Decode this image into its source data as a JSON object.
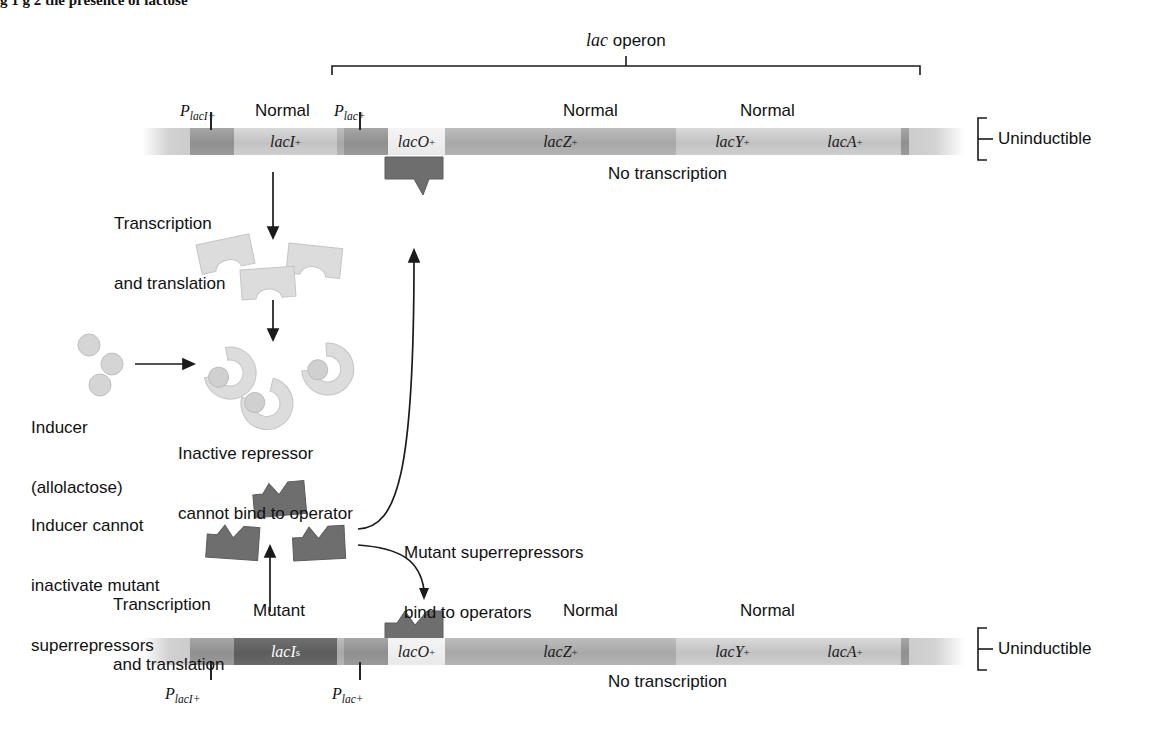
{
  "figure": {
    "caption_partial": "g 1 g 2 the presence of lactose",
    "operon_bracket_label_italic": "lac",
    "operon_bracket_label_rest": " operon"
  },
  "top_panel": {
    "outcome_label": "Uninductible",
    "transcription_status": "No transcription",
    "state_labels": [
      {
        "text": "Normal",
        "x": 255,
        "y": 101
      },
      {
        "text": "Normal",
        "x": 563,
        "y": 101
      },
      {
        "text": "Normal",
        "x": 740,
        "y": 101
      }
    ],
    "promoters": [
      {
        "label_main": "P",
        "label_sub": "lacI+",
        "x": 180,
        "y": 102,
        "tick_x": 210,
        "tick_y": 112,
        "tick_h": 18
      },
      {
        "label_main": "P",
        "label_sub": "lac+",
        "x": 334,
        "y": 102,
        "tick_x": 359,
        "tick_y": 112,
        "tick_h": 18
      }
    ],
    "segments": [
      {
        "name": "left-fade",
        "label": "",
        "sup": "",
        "x": 142,
        "w": 48,
        "style": "s-fadeL"
      },
      {
        "name": "promoter-lacI",
        "label": "",
        "sup": "",
        "x": 190,
        "w": 44,
        "style": "s-prom"
      },
      {
        "name": "lacI-gene",
        "label": "lacI",
        "sup": "+",
        "x": 234,
        "w": 103,
        "style": "s-light"
      },
      {
        "name": "spacer-1",
        "label": "",
        "sup": "",
        "x": 337,
        "w": 7,
        "style": "s-mid"
      },
      {
        "name": "promoter-lac",
        "label": "",
        "sup": "",
        "x": 344,
        "w": 44,
        "style": "s-prom"
      },
      {
        "name": "lacO-operator",
        "label": "lacO",
        "sup": "+",
        "x": 388,
        "w": 57,
        "style": "s-white"
      },
      {
        "name": "lacZ-gene",
        "label": "lacZ",
        "sup": "+",
        "x": 445,
        "w": 231,
        "style": "s-mid"
      },
      {
        "name": "lacY-gene",
        "label": "lacY",
        "sup": "+",
        "x": 676,
        "w": 113,
        "style": "s-light"
      },
      {
        "name": "lacA-gene",
        "label": "lacA",
        "sup": "+",
        "x": 789,
        "w": 112,
        "style": "s-light"
      },
      {
        "name": "spacer-2",
        "label": "",
        "sup": "",
        "x": 901,
        "w": 8,
        "style": "s-prom"
      },
      {
        "name": "right-fade",
        "label": "",
        "sup": "",
        "x": 909,
        "w": 56,
        "style": "s-fadeR"
      }
    ]
  },
  "bottom_panel": {
    "outcome_label": "Uninductible",
    "transcription_status": "No transcription",
    "state_labels": [
      {
        "text": "Mutant",
        "x": 253,
        "y": 601
      },
      {
        "text": "Normal",
        "x": 563,
        "y": 601
      },
      {
        "text": "Normal",
        "x": 740,
        "y": 601
      }
    ],
    "promoters": [
      {
        "label_main": "P",
        "label_sub": "lacI+",
        "x": 165,
        "y": 685,
        "tick_x": 210,
        "tick_y": 662,
        "tick_h": 18
      },
      {
        "label_main": "P",
        "label_sub": "lac+",
        "x": 332,
        "y": 685,
        "tick_x": 359,
        "tick_y": 662,
        "tick_h": 18
      }
    ],
    "segments": [
      {
        "name": "left-fade",
        "label": "",
        "sup": "",
        "x": 142,
        "w": 48,
        "style": "s-fadeL"
      },
      {
        "name": "promoter-lacI",
        "label": "",
        "sup": "",
        "x": 190,
        "w": 44,
        "style": "s-prom"
      },
      {
        "name": "lacIs-gene",
        "label": "lacI",
        "sup": "s",
        "x": 234,
        "w": 103,
        "style": "s-dark"
      },
      {
        "name": "spacer-1",
        "label": "",
        "sup": "",
        "x": 337,
        "w": 7,
        "style": "s-mid"
      },
      {
        "name": "promoter-lac",
        "label": "",
        "sup": "",
        "x": 344,
        "w": 44,
        "style": "s-prom"
      },
      {
        "name": "lacO-operator",
        "label": "lacO",
        "sup": "+",
        "x": 388,
        "w": 57,
        "style": "s-white"
      },
      {
        "name": "lacZ-gene",
        "label": "lacZ",
        "sup": "+",
        "x": 445,
        "w": 231,
        "style": "s-mid"
      },
      {
        "name": "lacY-gene",
        "label": "lacY",
        "sup": "+",
        "x": 676,
        "w": 113,
        "style": "s-light"
      },
      {
        "name": "lacA-gene",
        "label": "lacA",
        "sup": "+",
        "x": 789,
        "w": 112,
        "style": "s-light"
      },
      {
        "name": "spacer-2",
        "label": "",
        "sup": "",
        "x": 901,
        "w": 8,
        "style": "s-prom"
      },
      {
        "name": "right-fade",
        "label": "",
        "sup": "",
        "x": 909,
        "w": 56,
        "style": "s-fadeR"
      }
    ]
  },
  "annotations": {
    "transcription_translation_top_line1": "Transcription",
    "transcription_translation_top_line2": "and translation",
    "transcription_translation_bottom_line1": "Transcription",
    "transcription_translation_bottom_line2": "and translation",
    "inducer_line1": "Inducer",
    "inducer_line2": "(allolactose)",
    "inactive_repressor_line1": "Inactive repressor",
    "inactive_repressor_line2": "cannot bind to operator",
    "inducer_cannot_line1": "Inducer cannot",
    "inducer_cannot_line2": "inactivate mutant",
    "inducer_cannot_line3": "superrepressors",
    "bind_operators_line1": "Mutant superrepressors",
    "bind_operators_line2": "bind to operators"
  },
  "colors": {
    "gene_light": "#c8c8c8",
    "gene_mid": "#aeaeae",
    "promoter": "#969696",
    "mutant_gene": "#636363",
    "repressor_inactive": "#d7d7d7",
    "repressor_super": "#6d6d6d",
    "inducer_sphere": "#cfcfcf",
    "line": "#1b1b1b"
  }
}
